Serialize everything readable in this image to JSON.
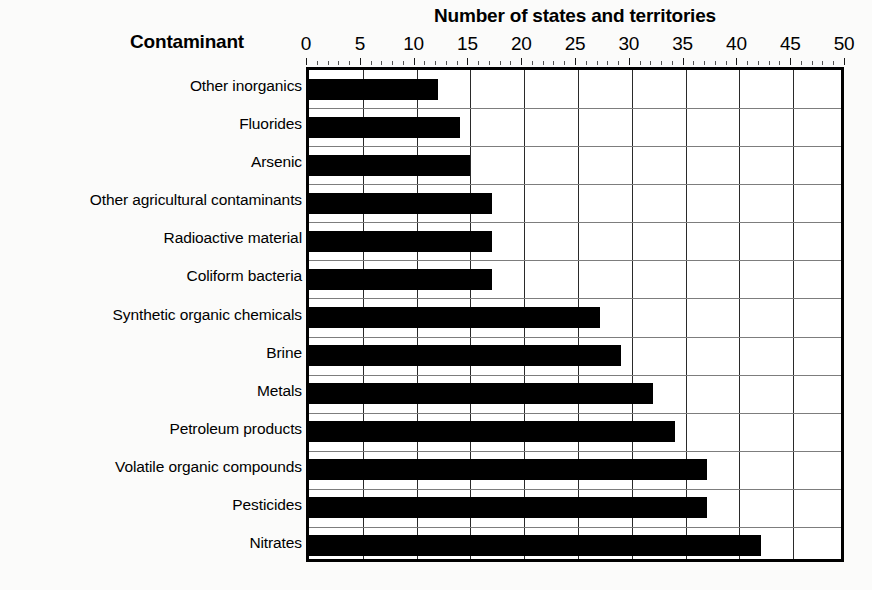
{
  "chart_data": {
    "type": "bar",
    "orientation": "horizontal",
    "title": "Number of states and territories",
    "xlabel": "Number of states and territories",
    "ylabel": "Contaminant",
    "xlim": [
      0,
      50
    ],
    "xticks": [
      0,
      5,
      10,
      15,
      20,
      25,
      30,
      35,
      40,
      45,
      50
    ],
    "xtick_labels": [
      "0",
      "5",
      "10",
      "15",
      "20",
      "25",
      "30",
      "35",
      "40",
      "45",
      "50"
    ],
    "x_minor_tick_step": 1,
    "grid": "both",
    "legend": "none",
    "bar_color": "#000000",
    "categories": [
      "Other inorganics",
      "Fluorides",
      "Arsenic",
      "Other agricultural contaminants",
      "Radioactive material",
      "Coliform bacteria",
      "Synthetic organic chemicals",
      "Brine",
      "Metals",
      "Petroleum products",
      "Volatile organic compounds",
      "Pesticides",
      "Nitrates"
    ],
    "values": [
      12,
      14,
      15,
      17,
      17,
      17,
      27,
      29,
      32,
      34,
      37,
      37,
      42
    ]
  },
  "figure": {
    "background_color": "#fbfbfa",
    "plot_background_color": "#ffffff",
    "border_color": "#000000",
    "gridline_color": "#7d7d7d"
  }
}
